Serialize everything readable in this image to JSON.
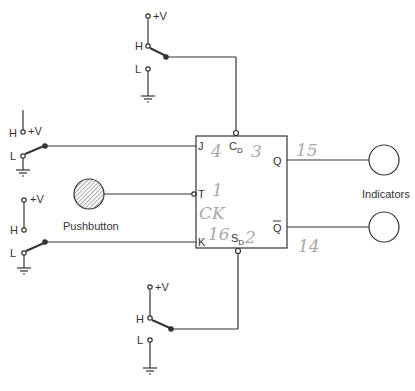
{
  "diagram": {
    "flip_flop": {
      "pins": {
        "j": "J",
        "k": "K",
        "t": "T",
        "cd": "C",
        "cd_sub": "D",
        "sd": "S",
        "sd_sub": "D",
        "q": "Q",
        "qbar": "Q"
      }
    },
    "switches": [
      {
        "name": "clear-switch",
        "vplus": "+V",
        "high": "H",
        "low": "L",
        "position": "H"
      },
      {
        "name": "j-switch",
        "vplus": "+V",
        "high": "H",
        "low": "L",
        "position": "L"
      },
      {
        "name": "k-switch",
        "vplus": "+V",
        "high": "H",
        "low": "L",
        "position": "L"
      },
      {
        "name": "set-switch",
        "vplus": "+V",
        "high": "H",
        "low": "L",
        "position": "H"
      }
    ],
    "pushbutton": {
      "label": "Pushbutton"
    },
    "indicators": {
      "label": "Indicators",
      "count": 2
    },
    "handwritten_notes": {
      "j_pin": "4",
      "cd_pin": "3",
      "q_pin": "15",
      "t_pin": "1",
      "t_pin_extra": "CK",
      "k_pin": "16",
      "sd_pin": "2",
      "qbar_pin": "14"
    }
  }
}
